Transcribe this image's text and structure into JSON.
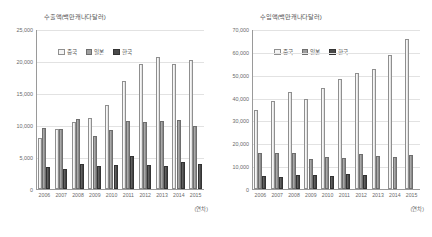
{
  "figure": {
    "background_color": "#ffffff",
    "series_colors": {
      "china": "#f2f2f2",
      "japan": "#9e9e9e",
      "korea": "#4a4a4a"
    },
    "axis_caption": "(연차)"
  },
  "chart_data": [
    {
      "type": "bar",
      "title": "수출액(백만캐나다달러)",
      "xlabel": "(연차)",
      "ylabel": "",
      "grid": true,
      "legend_position": "top-left",
      "ylim": [
        0,
        25000
      ],
      "yticks": [
        "0",
        "5,000",
        "10,000",
        "15,000",
        "20,000",
        "25,000"
      ],
      "ytick_values": [
        0,
        5000,
        10000,
        15000,
        20000,
        25000
      ],
      "categories": [
        "2006",
        "2007",
        "2008",
        "2009",
        "2010",
        "2011",
        "2012",
        "2013",
        "2014",
        "2015"
      ],
      "series": [
        {
          "name": "중국",
          "values": [
            7900,
            9400,
            10500,
            11100,
            13200,
            16900,
            19500,
            20600,
            19500,
            20200
          ]
        },
        {
          "name": "일본",
          "values": [
            9500,
            9300,
            11000,
            8300,
            9200,
            10600,
            10400,
            10600,
            10800,
            9800
          ]
        },
        {
          "name": "한국",
          "values": [
            3400,
            3100,
            3900,
            3600,
            3800,
            5200,
            3800,
            3600,
            4200,
            3900
          ]
        }
      ]
    },
    {
      "type": "bar",
      "title": "수입액(백만캐나다달러)",
      "xlabel": "(연차)",
      "ylabel": "",
      "grid": true,
      "legend_position": "top-left",
      "ylim": [
        0,
        70000
      ],
      "yticks": [
        "0",
        "10,000",
        "20,000",
        "30,000",
        "40,000",
        "50,000",
        "60,000",
        "70,000"
      ],
      "ytick_values": [
        0,
        10000,
        20000,
        30000,
        40000,
        50000,
        60000,
        70000
      ],
      "categories": [
        "2006",
        "2007",
        "2008",
        "2009",
        "2010",
        "2011",
        "2012",
        "2013",
        "2014",
        "2015"
      ],
      "series": [
        {
          "name": "중국",
          "values": [
            34600,
            38300,
            42500,
            39600,
            44300,
            48200,
            50800,
            52300,
            58700,
            65500
          ]
        },
        {
          "name": "일본",
          "values": [
            15800,
            15700,
            15600,
            13200,
            14100,
            13700,
            15500,
            14400,
            13800,
            15000
          ]
        },
        {
          "name": "한국",
          "values": [
            5800,
            5200,
            6100,
            6000,
            5900,
            6500,
            6000,
            0,
            0,
            0
          ]
        }
      ]
    }
  ],
  "panels": [
    {
      "id": "export-chart",
      "title": "수출액(백만캐나다달러)",
      "axis_caption": "(연차)",
      "legend": [
        {
          "key": "china",
          "label": "중국"
        },
        {
          "key": "japan",
          "label": "일본"
        },
        {
          "key": "korea",
          "label": "한국"
        }
      ]
    },
    {
      "id": "import-chart",
      "title": "수입액(백만캐나다달러)",
      "axis_caption": "(연차)",
      "legend": [
        {
          "key": "china",
          "label": "중국"
        },
        {
          "key": "japan",
          "label": "일본"
        },
        {
          "key": "korea",
          "label": "한국"
        }
      ]
    }
  ]
}
